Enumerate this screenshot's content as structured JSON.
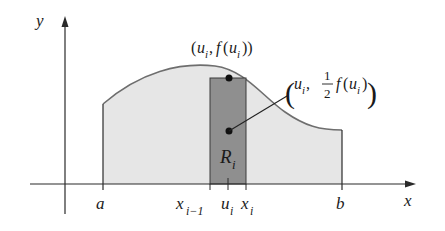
{
  "axes": {
    "x_label": "x",
    "y_label": "y"
  },
  "ticks": {
    "a": "a",
    "b": "b",
    "x_prev": "x",
    "x_prev_sub": "i−1",
    "u": "u",
    "u_sub": "i",
    "x_i": "x",
    "x_i_sub": "i"
  },
  "region_label": {
    "main": "R",
    "sub": "i"
  },
  "annotations": {
    "top_point": {
      "open": "(",
      "u": "u",
      "u_sub": "i",
      "comma": ", ",
      "f": "f",
      "paren_open": "(",
      "u2": "u",
      "u2_sub": "i",
      "close": "))"
    },
    "mid_point": {
      "open": "(",
      "u": "u",
      "u_sub": "i",
      "comma": ",",
      "frac_num": "1",
      "frac_den": "2",
      "f": "f",
      "paren_open": "(",
      "u2": "u",
      "u2_sub": "i",
      "close": ")",
      "big_close": ")"
    }
  },
  "colors": {
    "region_fill": "#e6e6e6",
    "rect_fill": "#8f8f8f",
    "curve": "#6e6e6e",
    "axis": "#2a2a2a"
  }
}
